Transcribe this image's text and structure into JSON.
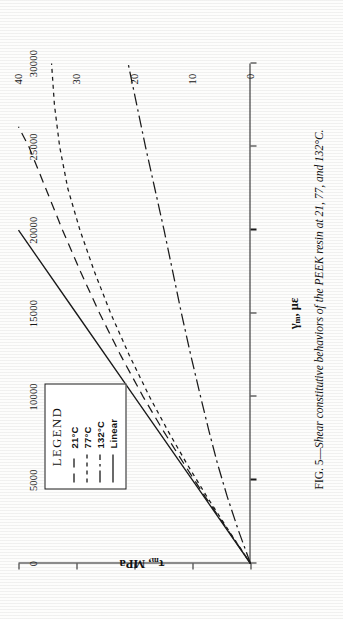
{
  "figure": {
    "caption_prefix": "FIG. 5—",
    "caption_text": "Shear constitutive behaviors of the PEEK resin at 21, 77, and 132°C."
  },
  "legend": {
    "title": "LEGEND",
    "entries": [
      {
        "label": "21°C",
        "style": "long-dash",
        "color": "#1a1a1a"
      },
      {
        "label": "77°C",
        "style": "short-dash",
        "color": "#1a1a1a"
      },
      {
        "label": "132°C",
        "style": "dash-dot",
        "color": "#1a1a1a"
      },
      {
        "label": "Linear",
        "style": "solid",
        "color": "#1a1a1a"
      }
    ]
  },
  "axes": {
    "x_title_main": "γ",
    "x_title_sub": "m",
    "x_title_rest": ",  με",
    "y_title_main": "τ",
    "y_title_sub": "m",
    "y_title_rest": ",  MPa",
    "x_ticks": [
      "0",
      "5000",
      "10000",
      "15000",
      "20000",
      "25000",
      "30000"
    ],
    "y_ticks": [
      "0",
      "10",
      "20",
      "30",
      "40"
    ]
  },
  "chart_data": {
    "type": "line",
    "title": "Shear constitutive behaviors of the PEEK resin at 21, 77, and 132°C",
    "xlabel": "γm, με",
    "ylabel": "τm, MPa",
    "xlim": [
      0,
      30000
    ],
    "ylim": [
      0,
      40
    ],
    "xticks": [
      0,
      5000,
      10000,
      15000,
      20000,
      25000,
      30000
    ],
    "yticks": [
      0,
      10,
      20,
      30,
      40
    ],
    "grid": false,
    "legend_position": "upper-left",
    "series": [
      {
        "name": "21°C",
        "style": "long-dash",
        "x": [
          0,
          2000,
          4000,
          6000,
          8000,
          10000,
          12500,
          15000,
          17500,
          20000,
          22500,
          25000,
          26200
        ],
        "y": [
          0,
          3.9,
          7.8,
          11.5,
          15.1,
          18.5,
          22.4,
          26.0,
          29.3,
          32.4,
          35.3,
          38.2,
          40.0
        ]
      },
      {
        "name": "77°C",
        "style": "short-dash",
        "x": [
          0,
          2000,
          4000,
          6000,
          8000,
          10000,
          12500,
          15000,
          17500,
          20000,
          22500,
          25000,
          27500,
          30000
        ],
        "y": [
          0,
          3.8,
          7.5,
          11.0,
          14.3,
          17.4,
          20.9,
          24.1,
          26.9,
          29.4,
          31.5,
          32.9,
          33.8,
          34.3
        ]
      },
      {
        "name": "132°C",
        "style": "dash-dot",
        "x": [
          0,
          2000,
          4000,
          6000,
          8000,
          10000,
          12500,
          15000,
          17500,
          20000,
          22500,
          25000,
          27500,
          30000
        ],
        "y": [
          0,
          2.1,
          4.0,
          5.7,
          7.2,
          8.6,
          10.3,
          11.9,
          13.4,
          14.9,
          16.5,
          18.1,
          19.6,
          21.1
        ]
      },
      {
        "name": "Linear",
        "style": "solid",
        "x": [
          0,
          5000,
          10000,
          15000,
          20000
        ],
        "y": [
          0,
          10.0,
          20.0,
          30.0,
          40.0
        ]
      }
    ]
  }
}
